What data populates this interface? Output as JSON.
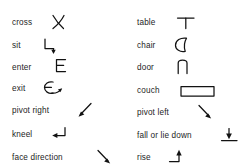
{
  "legend": {
    "columns": [
      {
        "name": "actions-column",
        "entries": [
          {
            "label": "cross",
            "icon": "cross-x-symbol",
            "top": 12
          },
          {
            "label": "sit",
            "icon": "sit-corner-down-arrow",
            "top": 35
          },
          {
            "label": "enter",
            "icon": "enter-letter-e",
            "top": 57
          },
          {
            "label": "exit",
            "icon": "exit-e-with-arrow",
            "top": 78
          },
          {
            "label": "pivot right",
            "icon": "pivot-right-up-arrow",
            "top": 100
          },
          {
            "label": "kneel",
            "icon": "kneel-return-arrow",
            "top": 124
          },
          {
            "label": "face direction",
            "icon": "face-direction-arrow",
            "top": 147
          }
        ]
      },
      {
        "name": "objects-column",
        "entries": [
          {
            "label": "table",
            "icon": "table-tee-symbol",
            "top": 12
          },
          {
            "label": "chair",
            "icon": "chair-teardrop-symbol",
            "top": 35
          },
          {
            "label": "door",
            "icon": "door-arch-symbol",
            "top": 57
          },
          {
            "label": "couch",
            "icon": "couch-rectangle-symbol",
            "top": 80
          },
          {
            "label": "pivot left",
            "icon": "pivot-left-down-arrow",
            "top": 102
          },
          {
            "label": "fall or lie down",
            "icon": "fall-down-arrow-ground",
            "top": 125
          },
          {
            "label": "rise",
            "icon": "rise-up-arrow",
            "top": 147
          }
        ]
      }
    ]
  },
  "colors": {
    "background": "#ffffff",
    "ink": "#121212",
    "text": "#1d1d1d"
  }
}
